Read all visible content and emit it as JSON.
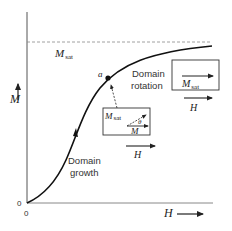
{
  "diagram": {
    "axes": {
      "y_label": "M",
      "x_label": "H",
      "origin_y_tick": "0",
      "origin_x_tick": "0"
    },
    "saturation_line": {
      "label_main": "M",
      "label_sub": "sat",
      "style": "dashed"
    },
    "point": {
      "label": "a"
    },
    "regions": {
      "growth_line1": "Domain",
      "growth_line2": "growth",
      "rotation_line1": "Domain",
      "rotation_line2": "rotation"
    },
    "inset_rotating": {
      "msat_main": "M",
      "msat_sub": "sat",
      "angle": "θ",
      "m_label": "M",
      "field_label": "H"
    },
    "inset_saturated": {
      "msat_main": "M",
      "msat_sub": "sat",
      "field_label": "H"
    },
    "colors": {
      "curve": "#111111",
      "axis": "#555555",
      "dashed": "#888888",
      "text": "#222222"
    }
  }
}
